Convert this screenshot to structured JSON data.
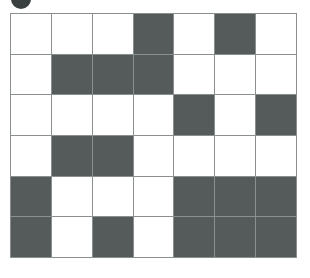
{
  "figure": {
    "type": "grid-pattern",
    "rows": 6,
    "columns": 7,
    "cell_states": [
      [
        "empty",
        "empty",
        "empty",
        "filled",
        "empty",
        "filled",
        "empty"
      ],
      [
        "empty",
        "filled",
        "filled",
        "filled",
        "empty",
        "empty",
        "empty"
      ],
      [
        "empty",
        "empty",
        "empty",
        "empty",
        "filled",
        "empty",
        "filled"
      ],
      [
        "empty",
        "filled",
        "filled",
        "empty",
        "empty",
        "empty",
        "empty"
      ],
      [
        "filled",
        "empty",
        "empty",
        "empty",
        "filled",
        "filled",
        "filled"
      ],
      [
        "filled",
        "empty",
        "filled",
        "empty",
        "filled",
        "filled",
        "filled"
      ]
    ],
    "filled_count": 18,
    "empty_count": 24,
    "colors": {
      "filled": "#555a5a",
      "empty": "#ffffff",
      "gridline": "#8a8f8f",
      "marker": "#3a3f3f",
      "background": "#ffffff"
    },
    "marker": {
      "name": "top-left-dot",
      "shape": "circle",
      "clipped": "top"
    }
  }
}
